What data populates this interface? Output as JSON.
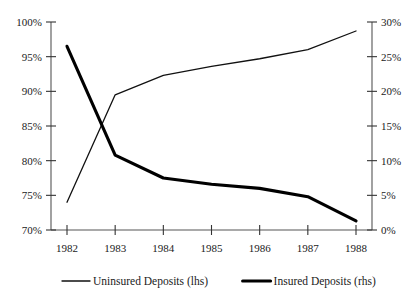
{
  "chart_data": {
    "type": "line",
    "title": "",
    "subtitle": "",
    "xlabel": "",
    "ylabel": "",
    "grid": false,
    "legend_position": "bottom",
    "categories": [
      "1982",
      "1983",
      "1984",
      "1985",
      "1986",
      "1987",
      "1988"
    ],
    "x_tick_labels": [
      "1982",
      "1983",
      "1984",
      "1985",
      "1986",
      "1987",
      "1988"
    ],
    "left_axis": {
      "label": "",
      "ylim": [
        70,
        100
      ],
      "tick_values": [
        70,
        75,
        80,
        85,
        90,
        95,
        100
      ],
      "tick_labels": [
        "70%",
        "75%",
        "80%",
        "85%",
        "90%",
        "95%",
        "100%"
      ]
    },
    "right_axis": {
      "label": "",
      "ylim": [
        0,
        30
      ],
      "tick_values": [
        0,
        5,
        10,
        15,
        20,
        25,
        30
      ],
      "tick_labels": [
        "0%",
        "5%",
        "10%",
        "15%",
        "20%",
        "25%",
        "30%"
      ]
    },
    "series": [
      {
        "name": "Uninsured Deposits (lhs)",
        "axis": "left",
        "style": "thin",
        "values": [
          74.0,
          89.5,
          92.3,
          93.6,
          94.7,
          96.0,
          98.7
        ]
      },
      {
        "name": "Insured Deposits (rhs)",
        "axis": "right",
        "style": "thick",
        "values": [
          26.5,
          10.8,
          7.5,
          6.6,
          6.0,
          4.8,
          1.3
        ]
      }
    ]
  },
  "legend": {
    "items": [
      {
        "label": "Uninsured Deposits (lhs)",
        "style": "thin"
      },
      {
        "label": "Insured Deposits (rhs)",
        "style": "thick"
      }
    ]
  },
  "colors": {
    "series_line": "#111111",
    "axis": "#555555",
    "text": "#1a1a1a",
    "background": "#ffffff"
  }
}
